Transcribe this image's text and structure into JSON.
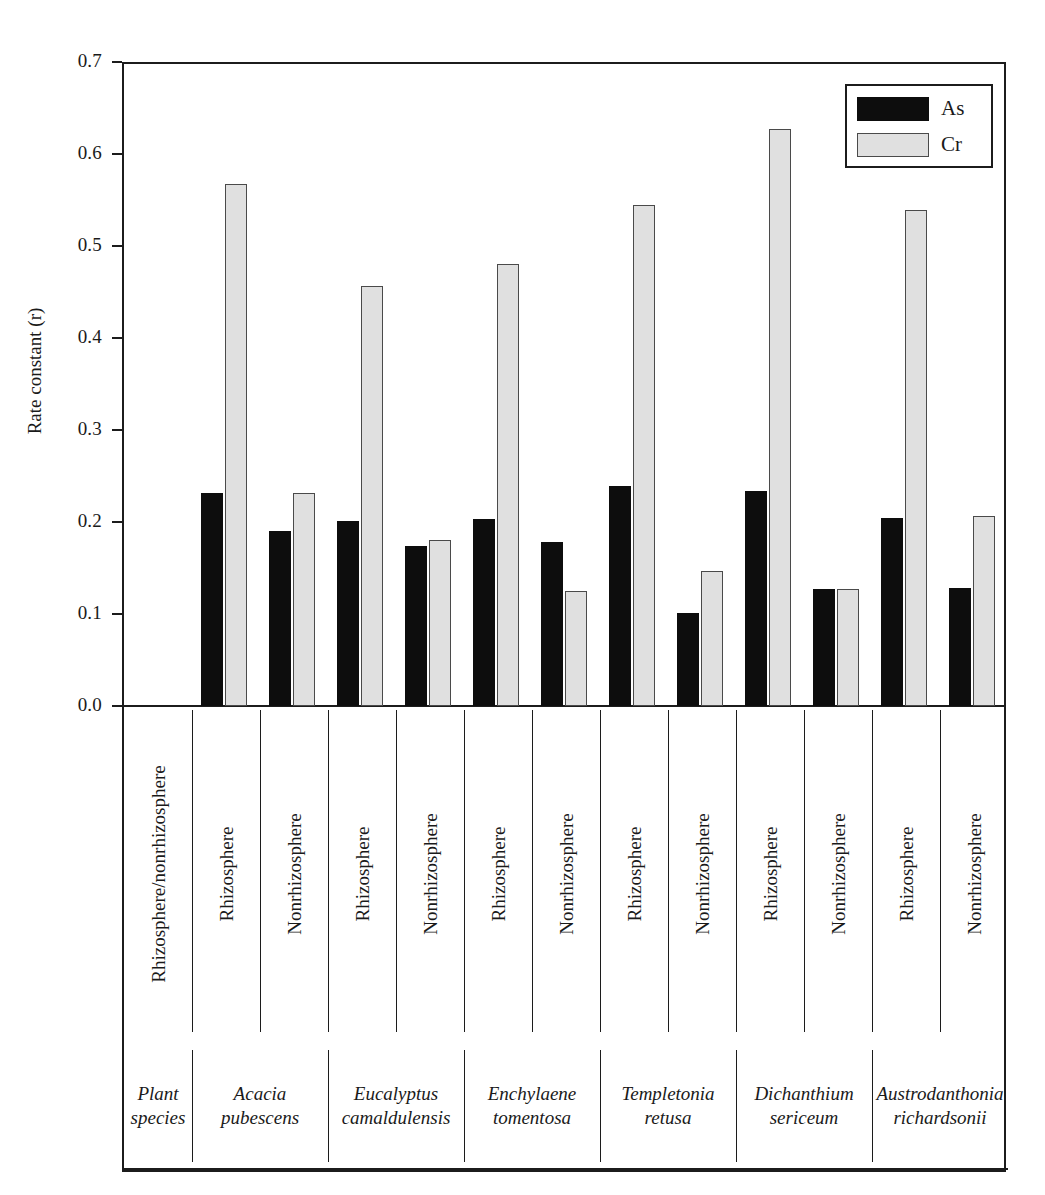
{
  "chart_data": {
    "type": "bar",
    "title": "",
    "xlabel": "Plant species",
    "ylabel": "Rate constant (r)",
    "ylim": [
      0.0,
      0.7
    ],
    "ytick_labels": [
      "0.0",
      "0.1",
      "0.2",
      "0.3",
      "0.4",
      "0.5",
      "0.6",
      "0.7"
    ],
    "ytick_values": [
      0.0,
      0.1,
      0.2,
      0.3,
      0.4,
      0.5,
      0.6,
      0.7
    ],
    "grid": false,
    "legend_position": "top-right",
    "legend": [
      "As",
      "Cr"
    ],
    "row_header_condition": "Rhizosphere/nonrhizosphere",
    "row_header_species": "Plant species",
    "categories": [
      "Acacia pubescens Rhizosphere",
      "Acacia pubescens Nonrhizosphere",
      "Eucalyptus camaldulensis Rhizosphere",
      "Eucalyptus camaldulensis Nonrhizosphere",
      "Enchylaene tomentosa Rhizosphere",
      "Enchylaene tomentosa Nonrhizosphere",
      "Templetonia retusa Rhizosphere",
      "Templetonia retusa Nonrhizosphere",
      "Dichanthium sericeum Rhizosphere",
      "Dichanthium sericeum Nonrhizosphere",
      "Austrodanthonia richardsonii Rhizosphere",
      "Austrodanthonia richardsonii Nonrhizosphere"
    ],
    "series": [
      {
        "name": "As",
        "color": "#0d0d0d",
        "values": [
          0.231,
          0.19,
          0.201,
          0.174,
          0.203,
          0.178,
          0.239,
          0.101,
          0.234,
          0.127,
          0.204,
          0.128
        ]
      },
      {
        "name": "Cr",
        "color": "#e0e0e0",
        "values": [
          0.567,
          0.231,
          0.456,
          0.18,
          0.48,
          0.125,
          0.545,
          0.147,
          0.627,
          0.127,
          0.539,
          0.206
        ]
      }
    ]
  },
  "axis": {
    "ylabel": "Rate constant (r)",
    "yticks": [
      "0.7",
      "0.6",
      "0.5",
      "0.4",
      "0.3",
      "0.2",
      "0.1",
      "0.0"
    ]
  },
  "legend": {
    "items": [
      {
        "label": "As",
        "swatch": "black"
      },
      {
        "label": "Cr",
        "swatch": "light-gray"
      }
    ]
  },
  "condition_row": {
    "header": "Rhizosphere/nonrhizosphere",
    "cells": [
      "Rhizosphere",
      "Nonrhizosphere",
      "Rhizosphere",
      "Nonrhizosphere",
      "Rhizosphere",
      "Nonrhizosphere",
      "Rhizosphere",
      "Nonrhizosphere",
      "Rhizosphere",
      "Nonrhizosphere",
      "Rhizosphere",
      "Nonrhizosphere"
    ]
  },
  "species_row": {
    "header": "Plant species",
    "cells": [
      "Acacia pubescens",
      "Eucalyptus camaldulensis",
      "Enchylaene tomentosa",
      "Templetonia retusa",
      "Dichanthium sericeum",
      "Austrodanthonia richardsonii"
    ]
  }
}
